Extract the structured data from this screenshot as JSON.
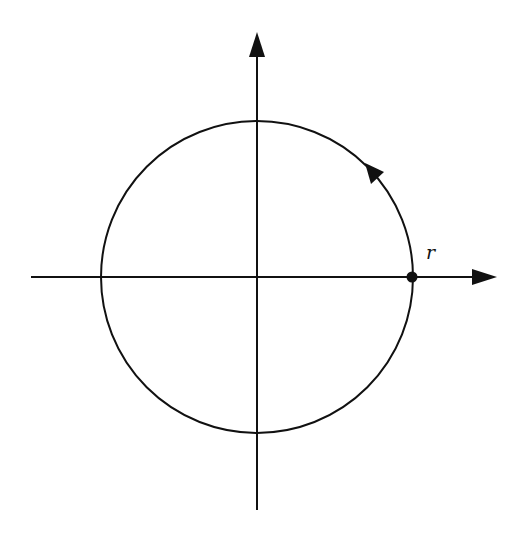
{
  "diagram": {
    "type": "circle-on-axes",
    "labels": {
      "point_label": "r"
    },
    "colors": {
      "stroke": "#111111",
      "background": "#ffffff"
    },
    "geometry": {
      "center": [
        257,
        277
      ],
      "radius": 156,
      "point": [
        412,
        277
      ],
      "direction": "counterclockwise"
    },
    "icons": {
      "x_axis_arrow": "arrow-right-icon",
      "y_axis_arrow": "arrow-up-icon",
      "circle_direction_arrow": "arrowhead-icon",
      "point_marker": "filled-dot-icon"
    }
  }
}
